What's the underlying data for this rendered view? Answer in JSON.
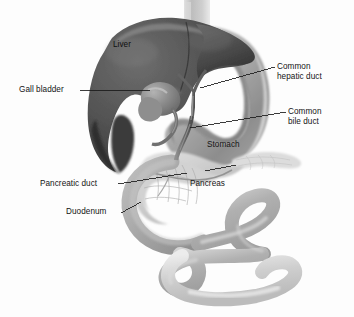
{
  "figure": {
    "background_color": "#fdfdfd",
    "width": 354,
    "height": 317,
    "style": "grayscale airbrushed medical illustration"
  },
  "labels": {
    "gall_bladder": "Gall bladder",
    "liver": "Liver",
    "common_hepatic_duct_line1": "Common",
    "common_hepatic_duct_line2": "hepatic duct",
    "common_bile_duct_line1": "Common",
    "common_bile_duct_line2": "bile duct",
    "stomach": "Stomach",
    "pancreatic_duct": "Pancreatic duct",
    "pancreas": "Pancreas",
    "duodenum": "Duodenum"
  },
  "structures": [
    {
      "name": "esophagus",
      "label": null,
      "fill": "#c9c9c9"
    },
    {
      "name": "liver",
      "label": "Liver",
      "fill": "#4e4e4e"
    },
    {
      "name": "gall-bladder",
      "label": "Gall bladder",
      "fill": "#7a7a7a"
    },
    {
      "name": "common-hepatic-duct",
      "label": "Common hepatic duct",
      "fill": "#6e6e6e"
    },
    {
      "name": "common-bile-duct",
      "label": "Common bile duct",
      "fill": "#6a6a6a"
    },
    {
      "name": "stomach",
      "label": "Stomach",
      "fill": "#9a9a9a"
    },
    {
      "name": "pancreas",
      "label": "Pancreas",
      "fill": "#c4c4c4"
    },
    {
      "name": "pancreatic-duct",
      "label": "Pancreatic duct",
      "fill": "#a9a9a9"
    },
    {
      "name": "duodenum",
      "label": "Duodenum",
      "fill": "#b0b0b0"
    },
    {
      "name": "small-intestine-loops",
      "label": null,
      "fill": "#b5b5b5"
    }
  ],
  "colors": {
    "ink": "#141414",
    "leader_line": "#1a1a1a",
    "liver_dark": "#3c3c3c",
    "liver_mid": "#575757",
    "liver_light": "#6f6f6f",
    "stomach_mid": "#9b9b9b",
    "pancreas_light": "#c8c8c8",
    "bowel_mid": "#b2b2b2",
    "bowel_light": "#dcdcdc",
    "background": "#fdfdfd"
  },
  "leader_lines": [
    {
      "name": "gall-bladder-leader",
      "from": [
        80,
        90
      ],
      "to": [
        150,
        90
      ]
    },
    {
      "name": "common-hepatic-duct-leader",
      "from": [
        200,
        88
      ],
      "to": [
        275,
        67
      ]
    },
    {
      "name": "common-bile-duct-leader",
      "from": [
        190,
        128
      ],
      "to": [
        286,
        112
      ]
    },
    {
      "name": "pancreatic-duct-leader",
      "from": [
        118,
        184
      ],
      "to": [
        187,
        173
      ]
    },
    {
      "name": "duodenum-leader",
      "from": [
        122,
        212
      ],
      "to": [
        140,
        202
      ]
    },
    {
      "name": "pancreas-leader",
      "from": [
        205,
        172
      ],
      "to": [
        235,
        166
      ]
    }
  ]
}
